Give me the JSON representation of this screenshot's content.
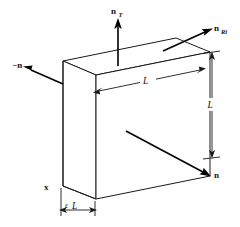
{
  "figure": {
    "type": "3d-line-diagram",
    "background_color": "#ffffff",
    "line_color": "#1a1a1a"
  },
  "labels": {
    "normal_top": {
      "symbol": "n",
      "subscript": "T"
    },
    "normal_right": {
      "symbol": "n",
      "subscript": "Ri"
    },
    "normal_left": {
      "text": "−n"
    },
    "normal_front": {
      "text": "n"
    },
    "axis_x": {
      "text": "x"
    },
    "dim_length": {
      "text": "L"
    },
    "dim_height": {
      "text": "L"
    },
    "dim_thickness": {
      "epsilon": "ε",
      "symbol": "L"
    }
  },
  "geometry": {
    "slab_front_face": "parallelogram",
    "slab_top_face": "parallelogram",
    "slab_side_face": "parallelogram",
    "thickness_relative": "epsilon times L"
  }
}
